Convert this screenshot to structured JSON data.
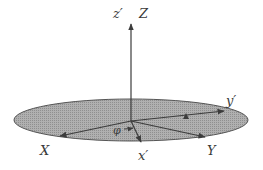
{
  "diagram": {
    "colors": {
      "disk_fill": "#a8a8a8",
      "line": "#3c3c3c",
      "text": "#3a3a3a"
    },
    "labels": {
      "z_prime": "z′",
      "Z": "Z",
      "X": "X",
      "Y": "Y",
      "x_prime": "x′",
      "y_prime": "y′",
      "phi": "φ"
    }
  }
}
